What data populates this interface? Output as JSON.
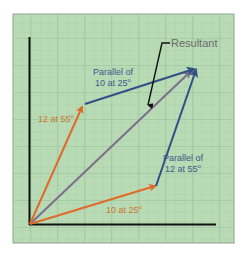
{
  "diagram": {
    "colors": {
      "background": "#ffffff",
      "panel": "#b7d9b4",
      "panel_border": "#8a9a8a",
      "grid_major": "#9dc49b",
      "grid_minor": "#a9cfa6",
      "axis": "#111111",
      "vector_orange": "#e06a2a",
      "vector_blue": "#2f4f86",
      "resultant": "#7d6e8c",
      "label_orange": "#c9792f",
      "label_blue": "#3b5b8a",
      "label_gray": "#6b6b6b"
    },
    "vectors": [
      {
        "name": "12 at 55",
        "label": "12 at 55",
        "superscript": "o",
        "color": "vector_orange"
      },
      {
        "name": "10 at 25",
        "label": "10 at 25",
        "superscript": "o",
        "color": "vector_orange"
      },
      {
        "name": "Parallel of 10 at 25",
        "label_line1": "Parallel of",
        "label_line2": "10 at 25",
        "superscript": "o",
        "color": "vector_blue"
      },
      {
        "name": "Parallel of 12 at 55",
        "label_line1": "Parallel of",
        "label_line2": "12 at 55",
        "superscript": "o",
        "color": "vector_blue"
      },
      {
        "name": "Resultant",
        "label": "Resultant",
        "color": "resultant"
      }
    ]
  }
}
